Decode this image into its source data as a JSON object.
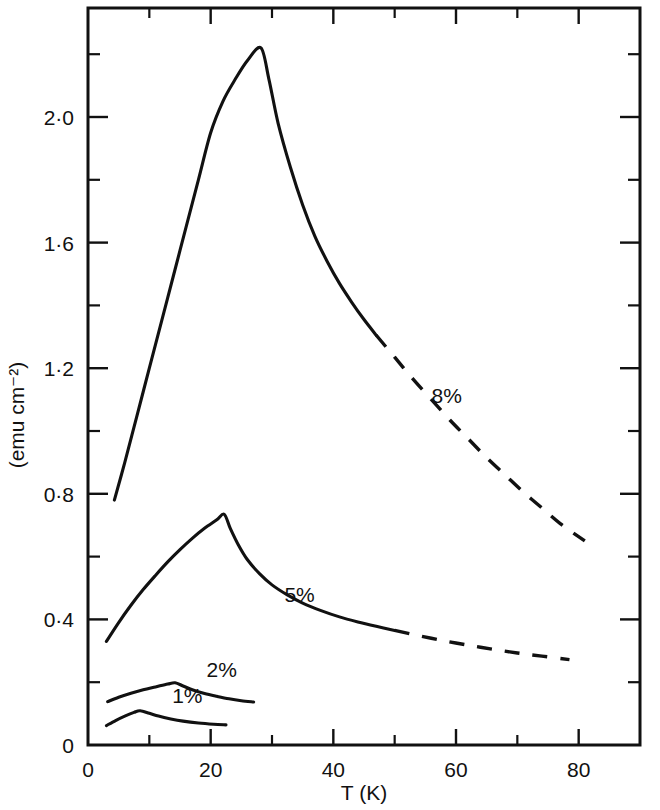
{
  "chart_data": {
    "type": "line",
    "title": "",
    "xlabel": "T (K)",
    "ylabel": "(emu cm⁻²)",
    "xlim": [
      0,
      90
    ],
    "ylim": [
      0,
      2.22
    ],
    "grid": false,
    "legend_position": "inline-annotations",
    "x_ticks_major": [
      0,
      20,
      40,
      60,
      80
    ],
    "x_ticks_major_labels": [
      "0",
      "20",
      "40",
      "60",
      "80"
    ],
    "x_ticks_minor": [
      10,
      30,
      50,
      70
    ],
    "y_ticks_major": [
      0,
      0.4,
      0.8,
      1.2,
      1.6,
      2.0
    ],
    "y_ticks_major_labels": [
      "0",
      "0·4",
      "0·8",
      "1·2",
      "1·6",
      "2·0"
    ],
    "y_ticks_minor": [
      0.2,
      0.6,
      1.0,
      1.4,
      1.8,
      2.2
    ],
    "series": [
      {
        "name": "8%",
        "label": "8%",
        "label_x": 58.5,
        "label_y": 1.09,
        "solid_points": [
          [
            4.3,
            0.78
          ],
          [
            6.0,
            0.9
          ],
          [
            8.0,
            1.05
          ],
          [
            10.0,
            1.2
          ],
          [
            12.0,
            1.35
          ],
          [
            14.0,
            1.5
          ],
          [
            16.0,
            1.65
          ],
          [
            18.0,
            1.8
          ],
          [
            20.0,
            1.95
          ],
          [
            22.0,
            2.05
          ],
          [
            24.0,
            2.12
          ],
          [
            26.0,
            2.18
          ],
          [
            28.2,
            2.22
          ],
          [
            29.5,
            2.12
          ],
          [
            31.0,
            1.98
          ],
          [
            33.0,
            1.84
          ],
          [
            35.0,
            1.72
          ],
          [
            37.0,
            1.62
          ],
          [
            39.0,
            1.54
          ],
          [
            41.0,
            1.47
          ],
          [
            43.0,
            1.41
          ],
          [
            45.0,
            1.355
          ],
          [
            47.0,
            1.305
          ]
        ],
        "dashed_points": [
          [
            47.0,
            1.305
          ],
          [
            50.0,
            1.235
          ],
          [
            53.0,
            1.165
          ],
          [
            56.0,
            1.1
          ],
          [
            59.0,
            1.035
          ],
          [
            62.0,
            0.975
          ],
          [
            65.0,
            0.915
          ],
          [
            68.0,
            0.86
          ],
          [
            71.0,
            0.805
          ],
          [
            74.0,
            0.755
          ],
          [
            77.0,
            0.705
          ],
          [
            81.0,
            0.65
          ]
        ]
      },
      {
        "name": "5%",
        "label": "5%",
        "label_x": 34.5,
        "label_y": 0.455,
        "solid_points": [
          [
            3.0,
            0.33
          ],
          [
            5.0,
            0.39
          ],
          [
            7.0,
            0.445
          ],
          [
            9.0,
            0.495
          ],
          [
            11.0,
            0.54
          ],
          [
            13.0,
            0.583
          ],
          [
            15.0,
            0.622
          ],
          [
            17.0,
            0.658
          ],
          [
            19.0,
            0.69
          ],
          [
            21.0,
            0.717
          ],
          [
            22.2,
            0.735
          ],
          [
            23.2,
            0.69
          ],
          [
            24.5,
            0.638
          ],
          [
            26.0,
            0.59
          ],
          [
            28.0,
            0.545
          ],
          [
            30.0,
            0.51
          ],
          [
            32.5,
            0.478
          ],
          [
            35.0,
            0.452
          ],
          [
            38.0,
            0.428
          ],
          [
            41.0,
            0.408
          ],
          [
            44.0,
            0.392
          ],
          [
            47.0,
            0.378
          ],
          [
            50.0,
            0.365
          ]
        ],
        "dashed_points": [
          [
            50.0,
            0.365
          ],
          [
            54.0,
            0.348
          ],
          [
            58.0,
            0.332
          ],
          [
            62.0,
            0.318
          ],
          [
            66.0,
            0.305
          ],
          [
            70.0,
            0.293
          ],
          [
            74.0,
            0.283
          ],
          [
            78.5,
            0.272
          ]
        ]
      },
      {
        "name": "2%",
        "label": "2%",
        "label_x": 21.8,
        "label_y": 0.215,
        "solid_points": [
          [
            3.2,
            0.138
          ],
          [
            5.0,
            0.152
          ],
          [
            7.0,
            0.165
          ],
          [
            9.0,
            0.176
          ],
          [
            11.0,
            0.185
          ],
          [
            13.0,
            0.194
          ],
          [
            14.2,
            0.198
          ],
          [
            15.5,
            0.188
          ],
          [
            17.0,
            0.176
          ],
          [
            19.0,
            0.164
          ],
          [
            21.0,
            0.155
          ],
          [
            23.0,
            0.147
          ],
          [
            25.0,
            0.141
          ],
          [
            27.0,
            0.137
          ]
        ],
        "dashed_points": []
      },
      {
        "name": "1%",
        "label": "1%",
        "label_x": 16.2,
        "label_y": 0.133,
        "solid_points": [
          [
            3.0,
            0.062
          ],
          [
            4.5,
            0.078
          ],
          [
            6.0,
            0.092
          ],
          [
            7.5,
            0.104
          ],
          [
            8.5,
            0.109
          ],
          [
            10.0,
            0.101
          ],
          [
            11.5,
            0.092
          ],
          [
            13.5,
            0.083
          ],
          [
            15.5,
            0.076
          ],
          [
            18.0,
            0.07
          ],
          [
            20.5,
            0.066
          ],
          [
            22.5,
            0.064
          ]
        ],
        "dashed_points": []
      }
    ]
  }
}
